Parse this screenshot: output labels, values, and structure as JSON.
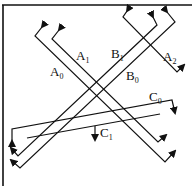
{
  "diagram": {
    "type": "crossing-arrow-lines",
    "frame": {
      "top_border": true,
      "left_border": true
    },
    "lines": [
      {
        "id": "A0",
        "base": "A",
        "sub": "0",
        "label_pos": [
          50,
          76
        ]
      },
      {
        "id": "A1",
        "base": "A",
        "sub": "1",
        "label_pos": [
          76,
          60
        ]
      },
      {
        "id": "A2",
        "base": "A",
        "sub": "2",
        "label_pos": [
          163,
          61
        ]
      },
      {
        "id": "B0",
        "base": "B",
        "sub": "0",
        "label_pos": [
          126,
          80
        ]
      },
      {
        "id": "B1",
        "base": "B",
        "sub": "1",
        "label_pos": [
          111,
          58
        ]
      },
      {
        "id": "C0",
        "base": "C",
        "sub": "0",
        "label_pos": [
          149,
          101
        ]
      },
      {
        "id": "C1",
        "base": "C",
        "sub": "1",
        "label_pos": [
          100,
          137
        ]
      }
    ],
    "colors": {
      "stroke": "#111111",
      "background": "#ffffff"
    }
  }
}
